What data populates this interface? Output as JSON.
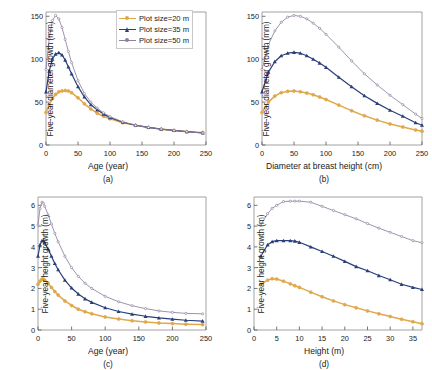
{
  "figure": {
    "legend": {
      "entries": [
        {
          "label": "Plot size=20 m",
          "color": "#e0a84a",
          "marker": "circle"
        },
        {
          "label": "Plot size=35 m",
          "color": "#2a3f7a",
          "marker": "triangle"
        },
        {
          "label": "Plot size=50 m",
          "color": "#8f7f9e",
          "marker": "circle"
        }
      ]
    }
  },
  "chart_data": [
    {
      "type": "line",
      "panel": "a",
      "caption": "(a)",
      "title": "",
      "xlabel": "Age (year)",
      "ylabel": "Five-year diameter growth (mm)",
      "xlim": [
        0,
        250
      ],
      "ylim": [
        0,
        155
      ],
      "xticks": [
        0,
        50,
        100,
        150,
        200,
        250
      ],
      "yticks": [
        0,
        50,
        100,
        150
      ],
      "grid": false,
      "legend_position": "top-right",
      "x": [
        0,
        5,
        10,
        15,
        20,
        25,
        30,
        35,
        40,
        50,
        60,
        70,
        80,
        90,
        100,
        120,
        140,
        160,
        180,
        200,
        220,
        245
      ],
      "series": [
        {
          "name": "Plot size=20 m",
          "color": "#e0a84a",
          "values": [
            38,
            47,
            54,
            59,
            62,
            63,
            63.5,
            63,
            61,
            55,
            48,
            42,
            37,
            33.5,
            30.5,
            26,
            23,
            20.5,
            18.5,
            17,
            15.5,
            14.5
          ]
        },
        {
          "name": "Plot size=35 m",
          "color": "#2a3f7a",
          "values": [
            62,
            86,
            100,
            106,
            107.5,
            105,
            99,
            91,
            83,
            68,
            56,
            47,
            41,
            36,
            32,
            26.5,
            23,
            20.5,
            18.5,
            17,
            15.5,
            14
          ]
        },
        {
          "name": "Plot size=50 m",
          "color": "#8f7f9e",
          "values": [
            88,
            124,
            145,
            151,
            147,
            137,
            123,
            109,
            96,
            75,
            60,
            50,
            43,
            37.5,
            33,
            27,
            23,
            20.5,
            18.5,
            17,
            15.5,
            14
          ]
        }
      ]
    },
    {
      "type": "line",
      "panel": "b",
      "caption": "(b)",
      "title": "",
      "xlabel": "Diameter at breast height (cm)",
      "ylabel": "Five-year diameter growth (mm)",
      "xlim": [
        0,
        250
      ],
      "ylim": [
        0,
        155
      ],
      "xticks": [
        0,
        50,
        100,
        150,
        200,
        250
      ],
      "yticks": [
        0,
        50,
        100,
        150
      ],
      "grid": false,
      "legend_position": "none",
      "x": [
        0,
        10,
        20,
        30,
        40,
        50,
        60,
        70,
        80,
        90,
        100,
        120,
        140,
        160,
        180,
        200,
        220,
        240,
        250
      ],
      "series": [
        {
          "name": "Plot size=20 m",
          "color": "#e0a84a",
          "values": [
            38,
            50,
            57,
            61,
            62.5,
            63,
            62,
            60.5,
            58.5,
            56,
            53,
            46.5,
            40,
            34,
            29,
            24.5,
            21,
            17.5,
            16
          ]
        },
        {
          "name": "Plot size=35 m",
          "color": "#2a3f7a",
          "values": [
            62,
            85,
            97,
            104,
            107,
            108,
            107,
            104,
            100,
            95.5,
            90.5,
            79,
            68,
            57.5,
            48.5,
            40.5,
            33.5,
            26,
            23
          ]
        },
        {
          "name": "Plot size=50 m",
          "color": "#8f7f9e",
          "values": [
            88,
            117,
            133,
            143,
            149,
            151,
            150,
            147,
            142,
            136,
            129,
            114,
            98,
            83,
            70,
            58,
            47,
            36,
            31
          ]
        }
      ]
    },
    {
      "type": "line",
      "panel": "c",
      "caption": "(c)",
      "title": "",
      "xlabel": "Age (year)",
      "ylabel": "Five-year height growth (m)",
      "xlim": [
        0,
        250
      ],
      "ylim": [
        0,
        6.4
      ],
      "xticks": [
        0,
        50,
        100,
        150,
        200,
        250
      ],
      "yticks": [
        0,
        1,
        2,
        3,
        4,
        5,
        6
      ],
      "grid": false,
      "legend_position": "none",
      "x": [
        0,
        3,
        6,
        8,
        10,
        15,
        20,
        25,
        30,
        40,
        50,
        60,
        70,
        80,
        100,
        120,
        140,
        160,
        180,
        200,
        220,
        245
      ],
      "series": [
        {
          "name": "Plot size=20 m",
          "color": "#e0a84a",
          "values": [
            2.2,
            2.35,
            2.45,
            2.45,
            2.4,
            2.25,
            2.05,
            1.85,
            1.68,
            1.4,
            1.18,
            1.0,
            0.88,
            0.78,
            0.63,
            0.53,
            0.45,
            0.39,
            0.34,
            0.31,
            0.28,
            0.26
          ]
        },
        {
          "name": "Plot size=35 m",
          "color": "#2a3f7a",
          "values": [
            3.55,
            4.1,
            4.3,
            4.3,
            4.2,
            3.9,
            3.55,
            3.2,
            2.9,
            2.4,
            2.02,
            1.73,
            1.5,
            1.33,
            1.07,
            0.89,
            0.76,
            0.66,
            0.58,
            0.52,
            0.47,
            0.43
          ]
        },
        {
          "name": "Plot size=50 m",
          "color": "#8f7f9e",
          "values": [
            5.05,
            5.85,
            6.15,
            6.1,
            5.95,
            5.55,
            5.1,
            4.65,
            4.25,
            3.55,
            3.0,
            2.58,
            2.25,
            2.0,
            1.62,
            1.36,
            1.17,
            1.03,
            0.92,
            0.85,
            0.8,
            0.78
          ]
        }
      ]
    },
    {
      "type": "line",
      "panel": "d",
      "caption": "(d)",
      "title": "",
      "xlabel": "Height (m)",
      "ylabel": "Five-year height growth (m)",
      "xlim": [
        0,
        37
      ],
      "ylim": [
        0,
        6.4
      ],
      "xticks": [
        0,
        5,
        10,
        15,
        20,
        25,
        30,
        35
      ],
      "yticks": [
        0,
        1,
        2,
        3,
        4,
        5,
        6
      ],
      "grid": false,
      "legend_position": "none",
      "x": [
        1.5,
        3,
        4,
        5,
        6.5,
        8,
        9,
        10,
        12.5,
        15,
        17.5,
        20,
        22.5,
        25,
        27.5,
        30,
        32.5,
        35,
        37
      ],
      "series": [
        {
          "name": "Plot size=20 m",
          "color": "#e0a84a",
          "values": [
            2.2,
            2.4,
            2.47,
            2.45,
            2.35,
            2.22,
            2.13,
            2.05,
            1.82,
            1.6,
            1.4,
            1.22,
            1.07,
            0.92,
            0.78,
            0.65,
            0.52,
            0.4,
            0.3
          ]
        },
        {
          "name": "Plot size=35 m",
          "color": "#2a3f7a",
          "values": [
            3.55,
            4.1,
            4.25,
            4.3,
            4.3,
            4.3,
            4.28,
            4.22,
            4.0,
            3.78,
            3.55,
            3.3,
            3.05,
            2.85,
            2.62,
            2.42,
            2.2,
            2.05,
            1.95
          ]
        },
        {
          "name": "Plot size=50 m",
          "color": "#8f7f9e",
          "values": [
            5.05,
            5.6,
            5.85,
            6.0,
            6.18,
            6.2,
            6.2,
            6.2,
            6.15,
            5.95,
            5.75,
            5.55,
            5.35,
            5.12,
            4.9,
            4.7,
            4.5,
            4.3,
            4.2
          ]
        }
      ]
    }
  ]
}
